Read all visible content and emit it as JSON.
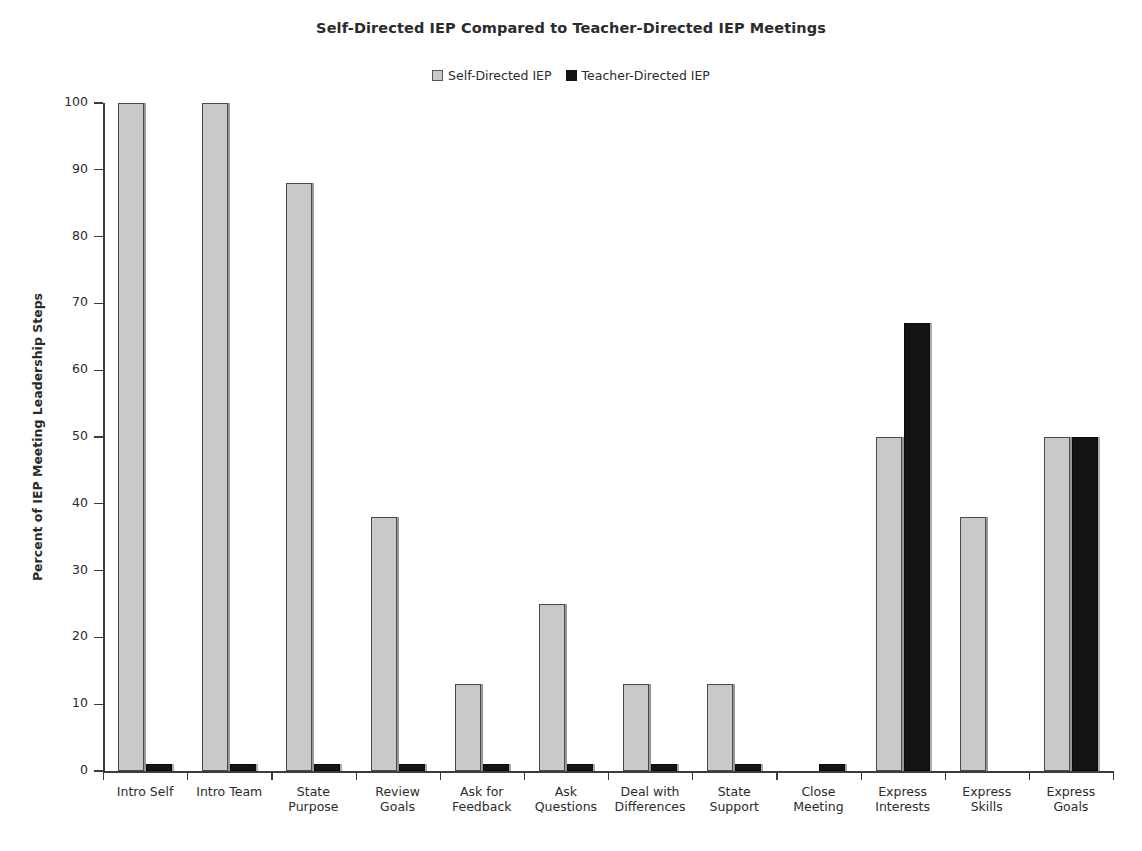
{
  "chart_data": {
    "type": "bar",
    "title": "Self-Directed IEP Compared to Teacher-Directed IEP Meetings",
    "xlabel": "",
    "ylabel": "Percent of IEP Meeting Leadership Steps",
    "ylim": [
      0,
      100
    ],
    "yticks": [
      0,
      10,
      20,
      30,
      40,
      50,
      60,
      70,
      80,
      90,
      100
    ],
    "ytick_labels": [
      "0",
      "10",
      "20",
      "30",
      "40",
      "50",
      "60",
      "70",
      "80",
      "90",
      "100"
    ],
    "grid": false,
    "legend_position": "top-center",
    "categories": [
      "Intro Self",
      "Intro Team",
      "State Purpose",
      "Review Goals",
      "Ask for Feedback",
      "Ask Questions",
      "Deal with Differences",
      "State Support",
      "Close Meeting",
      "Express Interests",
      "Express Skills",
      "Express Goals"
    ],
    "category_lines": [
      [
        "Intro Self"
      ],
      [
        "Intro Team"
      ],
      [
        "State",
        "Purpose"
      ],
      [
        "Review",
        "Goals"
      ],
      [
        "Ask for",
        "Feedback"
      ],
      [
        "Ask",
        "Questions"
      ],
      [
        "Deal with",
        "Differences"
      ],
      [
        "State",
        "Support"
      ],
      [
        "Close",
        "Meeting"
      ],
      [
        "Express",
        "Interests"
      ],
      [
        "Express",
        "Skills"
      ],
      [
        "Express",
        "Goals"
      ]
    ],
    "series": [
      {
        "name": "Self-Directed IEP",
        "color": "#c9c9c9",
        "values": [
          100,
          100,
          88,
          38,
          13,
          25,
          13,
          13,
          0,
          50,
          38,
          50
        ]
      },
      {
        "name": "Teacher-Directed IEP",
        "color": "#141414",
        "values": [
          1,
          1,
          1,
          1,
          1,
          1,
          1,
          1,
          1,
          67,
          0,
          50
        ]
      }
    ]
  },
  "legend": {
    "items": [
      {
        "label": "Self-Directed IEP",
        "color": "#c9c9c9"
      },
      {
        "label": "Teacher-Directed IEP",
        "color": "#141414"
      }
    ]
  },
  "axes": {
    "y_title": "Percent of IEP Meeting Leadership Steps"
  }
}
